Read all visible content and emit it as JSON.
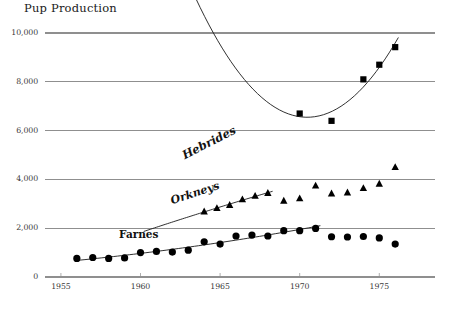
{
  "chart_data": {
    "type": "scatter",
    "title": "Pup Production",
    "xlabel": "",
    "ylabel": "",
    "xlim": [
      1954.0,
      1978.5
    ],
    "ylim": [
      0,
      10000
    ],
    "xticks": [
      1955,
      1960,
      1965,
      1970,
      1975
    ],
    "xtick_labels": [
      "1955",
      "1960",
      "1965",
      "1970",
      "1975"
    ],
    "yticks": [
      0,
      2000,
      4000,
      6000,
      8000,
      10000
    ],
    "ytick_labels": [
      "0",
      "2,000",
      "4,000",
      "6,000",
      "8,000",
      "10,000"
    ],
    "grid": "horizontal",
    "legend": "inline-labels",
    "marker_color": "#000000",
    "grid_color": "#8f8f8f",
    "series": [
      {
        "name": "Farnes",
        "marker": "circle",
        "label_position": "inline-left",
        "x": [
          1956,
          1957,
          1958,
          1959,
          1960,
          1961,
          1962,
          1963,
          1964,
          1965,
          1966,
          1967,
          1968,
          1969,
          1970,
          1971,
          1972,
          1973,
          1974,
          1975,
          1976
        ],
        "values": [
          760,
          800,
          760,
          780,
          1000,
          1050,
          1020,
          1100,
          1440,
          1350,
          1680,
          1720,
          1680,
          1900,
          1900,
          1990,
          1650,
          1640,
          1660,
          1600,
          1350
        ]
      },
      {
        "name": "Orkneys",
        "marker": "triangle",
        "label_position": "inline-left",
        "x": [
          1964,
          1964.8,
          1965.6,
          1966.4,
          1967.2,
          1968,
          1969,
          1970,
          1971,
          1972,
          1973,
          1974,
          1975,
          1976
        ],
        "values": [
          2680,
          2820,
          2950,
          3180,
          3320,
          3440,
          3120,
          3220,
          3740,
          3420,
          3460,
          3640,
          3820,
          4500
        ]
      },
      {
        "name": "Hebrides",
        "marker": "square",
        "label_position": "inline-left",
        "x": [
          1970,
          1972,
          1974,
          1975,
          1976
        ],
        "values": [
          6700,
          6400,
          8100,
          8700,
          9420
        ]
      }
    ],
    "trend_curves": [
      {
        "series": "Farnes",
        "x_start": 1956,
        "x_end": 1971.3
      },
      {
        "series": "Orkneys",
        "x_start": 1960.2,
        "x_end": 1968.3
      },
      {
        "series": "Hebrides",
        "x_start": 1959.6,
        "x_end": 1976.2
      }
    ]
  },
  "labels": {
    "farnes": "Farnes",
    "orkneys": "Orkneys",
    "hebrides": "Hebrides"
  }
}
